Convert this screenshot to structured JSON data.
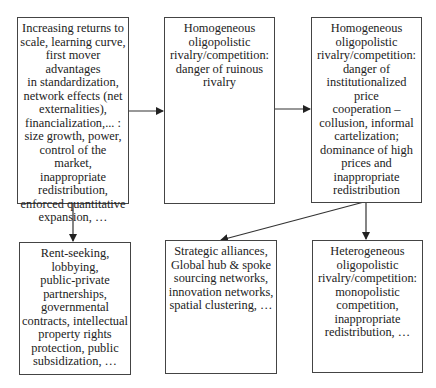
{
  "diagram": {
    "nodes": [
      {
        "id": "drivers",
        "text": "Increasing returns to\nscale, learning curve,\nfirst mover advantages\nin standardization,\nnetwork effects (net\nexternalities),\nfinancialization,... :\nsize growth, power,\ncontrol of the market,\ninappropriate\nredistribution,\nenforced quantitative\nexpansion, …"
      },
      {
        "id": "ruinous-rivalry",
        "text": "Homogeneous\noligopolistic\nrivalry/competition:\ndanger of ruinous\nrivalry"
      },
      {
        "id": "price-cooperation",
        "text": "Homogeneous\noligopolistic\nrivalry/competition:\ndanger of\ninstitutionalized price\ncooperation –\ncollusion, informal\ncartelization;\ndominance of high\nprices and\ninappropriate\nredistribution"
      },
      {
        "id": "rent-seeking",
        "text": "Rent-seeking,\nlobbying,\npublic-private\npartnerships,\ngovernmental\ncontracts, intellectual\nproperty rights\nprotection, public\nsubsidization, …"
      },
      {
        "id": "strategic-alliances",
        "text": "Strategic alliances,\nGlobal hub & spoke\nsourcing networks,\ninnovation networks,\nspatial clustering, …"
      },
      {
        "id": "heterogeneous",
        "text": "Heterogeneous\noligopolistic\nrivalry/competition:\nmonopolistic\ncompetition,\ninappropriate\nredistribution, …"
      }
    ],
    "edges": [
      {
        "from": "drivers",
        "to": "ruinous-rivalry"
      },
      {
        "from": "ruinous-rivalry",
        "to": "price-cooperation"
      },
      {
        "from": "drivers",
        "to": "rent-seeking"
      },
      {
        "from": "price-cooperation",
        "to": "strategic-alliances"
      },
      {
        "from": "price-cooperation",
        "to": "heterogeneous"
      }
    ],
    "colors": {
      "line": "#333333",
      "border": "#444444",
      "text": "#222222",
      "background": "#ffffff"
    }
  }
}
